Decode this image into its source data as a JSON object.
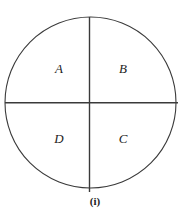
{
  "figure": {
    "caption": "(i)",
    "shape": "circle",
    "geometry": {
      "center_x": 90.5,
      "center_y": 102.5,
      "radius": 85.5,
      "vertical_line_top_y": 17,
      "vertical_line_bottom_y": 192,
      "horizontal_line_left_x": 5,
      "horizontal_line_right_x": 178
    },
    "colors": {
      "background": "#ffffff",
      "stroke": "#3a3a3a",
      "text": "#1c1c1c"
    },
    "quadrants": [
      {
        "id": "A",
        "label": "A",
        "position": "top-left"
      },
      {
        "id": "B",
        "label": "B",
        "position": "top-right"
      },
      {
        "id": "C",
        "label": "C",
        "position": "bottom-right"
      },
      {
        "id": "D",
        "label": "D",
        "position": "bottom-left"
      }
    ]
  }
}
